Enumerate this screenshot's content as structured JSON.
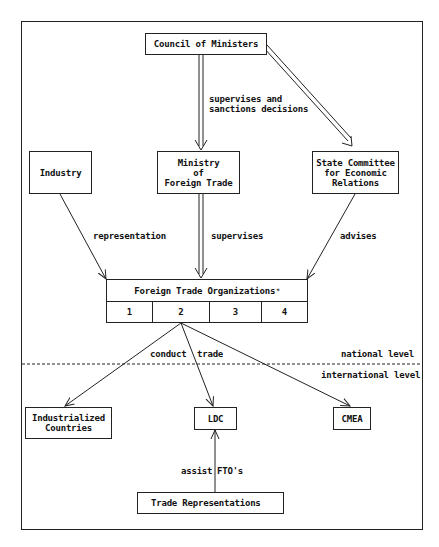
{
  "diagram": {
    "nodes": {
      "council": "Council of Ministers",
      "industry": "Industry",
      "ministry": "Ministry\nof\nForeign Trade",
      "state_committee": "State Committee\nfor Economic\nRelations",
      "fto": {
        "title": "Foreign Trade Organizations",
        "footnote_mark": "*",
        "cells": [
          "1",
          "2",
          "3",
          "4"
        ]
      },
      "industrialized": "Industrialized\nCountries",
      "ldc": "LDC",
      "cmea": "CMEA",
      "trade_reps": "Trade Representations"
    },
    "edge_labels": {
      "supervises_sanctions": "supervises and\nsanctions decisions",
      "representation": "representation",
      "supervises": "supervises",
      "advises": "advises",
      "conduct_trade_left": "conduct",
      "conduct_trade_right": "trade",
      "assist_left": "assist",
      "assist_right": "FTO's"
    },
    "levels": {
      "national": "national level",
      "international": "international level"
    },
    "edges": [
      {
        "from": "Council of Ministers",
        "to": "Ministry of Foreign Trade",
        "style": "double",
        "label": "supervises and sanctions decisions"
      },
      {
        "from": "Council of Ministers",
        "to": "State Committee for Economic Relations",
        "style": "double"
      },
      {
        "from": "Industry",
        "to": "Foreign Trade Organizations",
        "style": "single",
        "label": "representation"
      },
      {
        "from": "Ministry of Foreign Trade",
        "to": "Foreign Trade Organizations",
        "style": "double",
        "label": "supervises"
      },
      {
        "from": "State Committee for Economic Relations",
        "to": "Foreign Trade Organizations",
        "style": "single",
        "label": "advises"
      },
      {
        "from": "Foreign Trade Organizations",
        "to": "Industrialized Countries",
        "style": "single",
        "label": "conduct trade"
      },
      {
        "from": "Foreign Trade Organizations",
        "to": "LDC",
        "style": "single",
        "label": "conduct trade"
      },
      {
        "from": "Foreign Trade Organizations",
        "to": "CMEA",
        "style": "single",
        "label": "conduct trade"
      },
      {
        "from": "Trade Representations",
        "to": "LDC",
        "style": "single",
        "label": "assist FTO's"
      }
    ]
  }
}
